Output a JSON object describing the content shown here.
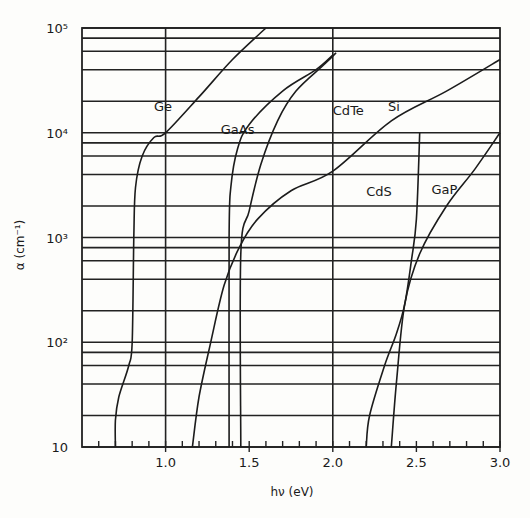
{
  "chart_data": {
    "type": "line",
    "title": "",
    "xlabel": "hν (eV)",
    "ylabel": "α (cm⁻¹)",
    "xscale": "linear",
    "yscale": "log",
    "xlim": [
      0.5,
      3.0
    ],
    "ylim": [
      10,
      100000
    ],
    "grid": true,
    "legend": "inline curve labels",
    "x_tick_labels": [
      "1.0",
      "1.5",
      "2.0",
      "2.5",
      "3.0"
    ],
    "x_ticks": [
      1.0,
      1.5,
      2.0,
      2.5,
      3.0
    ],
    "x_minor_step": 0.1,
    "y_tick_labels": [
      "10",
      "10²",
      "10³",
      "10⁴",
      "10⁵"
    ],
    "y_ticks": [
      10,
      100,
      1000,
      10000,
      100000
    ],
    "y_minor_multipliers": [
      2,
      4,
      6,
      8
    ],
    "vertical_gridlines": [
      1.0,
      2.0
    ],
    "series": [
      {
        "name": "Ge",
        "label_pos": [
          0.93,
          16000
        ],
        "points": [
          [
            0.7,
            10
          ],
          [
            0.7,
            18
          ],
          [
            0.72,
            30
          ],
          [
            0.78,
            60
          ],
          [
            0.8,
            100
          ],
          [
            0.81,
            1000
          ],
          [
            0.82,
            3000
          ],
          [
            0.86,
            6000
          ],
          [
            0.93,
            9000
          ],
          [
            1.0,
            10000
          ],
          [
            1.2,
            22000
          ],
          [
            1.4,
            50000
          ],
          [
            1.6,
            100000
          ]
        ]
      },
      {
        "name": "GaAs",
        "label_pos": [
          1.33,
          9800
        ],
        "points": [
          [
            1.38,
            10
          ],
          [
            1.38,
            1000
          ],
          [
            1.39,
            3000
          ],
          [
            1.43,
            7000
          ],
          [
            1.5,
            12000
          ],
          [
            1.7,
            25000
          ],
          [
            1.9,
            40000
          ],
          [
            2.0,
            55000
          ]
        ]
      },
      {
        "name": "CdTe",
        "label_pos": [
          2.0,
          14800
        ],
        "points": [
          [
            1.45,
            10
          ],
          [
            1.45,
            700
          ],
          [
            1.5,
            1800
          ],
          [
            1.57,
            5000
          ],
          [
            1.67,
            13000
          ],
          [
            1.78,
            25000
          ],
          [
            1.95,
            45000
          ],
          [
            2.02,
            58000
          ]
        ]
      },
      {
        "name": "Si",
        "label_pos": [
          2.33,
          16000
        ],
        "points": [
          [
            1.16,
            10
          ],
          [
            1.2,
            30
          ],
          [
            1.27,
            100
          ],
          [
            1.35,
            350
          ],
          [
            1.44,
            800
          ],
          [
            1.55,
            1500
          ],
          [
            1.75,
            2800
          ],
          [
            2.0,
            4300
          ],
          [
            2.35,
            13000
          ],
          [
            2.68,
            25000
          ],
          [
            3.0,
            50000
          ]
        ]
      },
      {
        "name": "CdS",
        "label_pos": [
          2.2,
          2500
        ],
        "points": [
          [
            2.2,
            10
          ],
          [
            2.22,
            20
          ],
          [
            2.31,
            60
          ],
          [
            2.38,
            120
          ],
          [
            2.43,
            230
          ],
          [
            2.47,
            600
          ],
          [
            2.5,
            1500
          ],
          [
            2.52,
            10000
          ]
        ]
      },
      {
        "name": "GaP",
        "label_pos": [
          2.59,
          2600
        ],
        "points": [
          [
            2.35,
            10
          ],
          [
            2.38,
            40
          ],
          [
            2.43,
            230
          ],
          [
            2.52,
            700
          ],
          [
            2.68,
            2000
          ],
          [
            2.85,
            4500
          ],
          [
            3.0,
            10000
          ]
        ]
      }
    ]
  }
}
